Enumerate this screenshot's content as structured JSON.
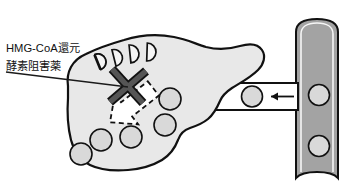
{
  "figure": {
    "background_color": "#ffffff",
    "width": 354,
    "height": 196
  },
  "annotation": {
    "label_line1": "HMG-CoA還元",
    "label_line2": "酵素阻害薬",
    "label_full": "HMG-CoA還元酵素阻害薬",
    "text_color": "#111111",
    "leader_line_color": "#1a1a1a"
  },
  "liver": {
    "name": "肝臓",
    "fill_color": "#e8e8e8",
    "outline_color": "#111111",
    "outline_width": 2.0
  },
  "cholesterol_synthesis": {
    "name": "コレステロール合成",
    "crescent_count": 4,
    "crescent_fill": "#f2f2f2",
    "crescent_outline": "#111111",
    "arrow_fill": "#ffffff",
    "arrow_outline_style": "dashed",
    "arrow_direction": "down-right",
    "blocked": true
  },
  "blocker": {
    "name": "阻害マーク",
    "symbol": "X",
    "color": "#4d4d4d",
    "outline_color": "#111111",
    "stroke_width": 7
  },
  "ldl_particles": {
    "name": "LDL粒子",
    "fill_color": "#d9d9d9",
    "outline_color": "#111111",
    "count_in_liver": 6,
    "count_on_arrow": 1,
    "count_in_vessel": 2
  },
  "uptake_arrow": {
    "name": "取り込み矢印",
    "direction": "left",
    "fill_color": "#ffffff",
    "outline_color": "#111111"
  },
  "flow_arrow": {
    "name": "流れ矢印",
    "direction": "left",
    "color": "#111111"
  },
  "blood_vessel": {
    "name": "血管",
    "fill_color": "#a3a3a3",
    "outline_color": "#111111",
    "highlight_color": "#ffffff"
  }
}
